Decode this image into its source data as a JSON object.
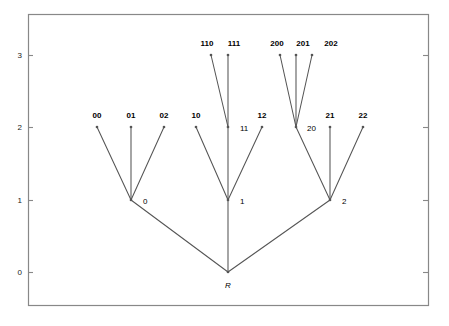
{
  "chart_data": {
    "type": "diagram-tree",
    "title": "",
    "xlabel": "",
    "ylabel": "",
    "ylim": [
      -0.45,
      3.45
    ],
    "xlim": [
      0,
      10
    ],
    "yticks": [
      0,
      1,
      2,
      3
    ],
    "ytick_labels": [
      "0",
      "1",
      "2",
      "3"
    ],
    "grid": false,
    "legend": null,
    "frame": true,
    "x_axis_visible_ticks": false,
    "nodes": [
      {
        "id": "R",
        "label": "R",
        "depth": 0,
        "x": 228,
        "y": 272,
        "label_x": 228,
        "label_y": 288,
        "label_style": "italic",
        "label_anchor": "middle",
        "marker": true
      },
      {
        "id": "0",
        "label": "0",
        "depth": 1,
        "x": 131,
        "y": 200,
        "label_x": 143,
        "label_y": 204,
        "label_style": "plain",
        "label_anchor": "start",
        "marker": true
      },
      {
        "id": "1",
        "label": "1",
        "depth": 1,
        "x": 228,
        "y": 200,
        "label_x": 240,
        "label_y": 204,
        "label_style": "plain",
        "label_anchor": "start",
        "marker": true
      },
      {
        "id": "2",
        "label": "2",
        "depth": 1,
        "x": 330,
        "y": 200,
        "label_x": 342,
        "label_y": 204,
        "label_style": "plain",
        "label_anchor": "start",
        "marker": true
      },
      {
        "id": "00",
        "label": "00",
        "depth": 2,
        "x": 97,
        "y": 127,
        "label_x": 97,
        "label_y": 118,
        "label_style": "bold",
        "label_anchor": "middle",
        "marker": true
      },
      {
        "id": "01",
        "label": "01",
        "depth": 2,
        "x": 131,
        "y": 127,
        "label_x": 131,
        "label_y": 118,
        "label_style": "bold",
        "label_anchor": "middle",
        "marker": true
      },
      {
        "id": "02",
        "label": "02",
        "depth": 2,
        "x": 164,
        "y": 127,
        "label_x": 164,
        "label_y": 118,
        "label_style": "bold",
        "label_anchor": "middle",
        "marker": true
      },
      {
        "id": "10",
        "label": "10",
        "depth": 2,
        "x": 196,
        "y": 127,
        "label_x": 196,
        "label_y": 118,
        "label_style": "bold",
        "label_anchor": "middle",
        "marker": true
      },
      {
        "id": "11",
        "label": "11",
        "depth": 2,
        "x": 228,
        "y": 127,
        "label_x": 240,
        "label_y": 131,
        "label_style": "plain",
        "label_anchor": "start",
        "marker": true
      },
      {
        "id": "12",
        "label": "12",
        "depth": 2,
        "x": 262,
        "y": 127,
        "label_x": 262,
        "label_y": 118,
        "label_style": "bold",
        "label_anchor": "middle",
        "marker": true
      },
      {
        "id": "20",
        "label": "20",
        "depth": 2,
        "x": 296,
        "y": 127,
        "label_x": 307,
        "label_y": 131,
        "label_style": "plain",
        "label_anchor": "start",
        "marker": true
      },
      {
        "id": "21",
        "label": "21",
        "depth": 2,
        "x": 330,
        "y": 127,
        "label_x": 330,
        "label_y": 118,
        "label_style": "bold",
        "label_anchor": "middle",
        "marker": true
      },
      {
        "id": "22",
        "label": "22",
        "depth": 2,
        "x": 363,
        "y": 127,
        "label_x": 363,
        "label_y": 118,
        "label_style": "bold",
        "label_anchor": "middle",
        "marker": true
      },
      {
        "id": "110",
        "label": "110",
        "depth": 3,
        "x": 211,
        "y": 55,
        "label_x": 207,
        "label_y": 46,
        "label_style": "bold",
        "label_anchor": "middle",
        "marker": true
      },
      {
        "id": "111",
        "label": "111",
        "depth": 3,
        "x": 228,
        "y": 55,
        "label_x": 234,
        "label_y": 46,
        "label_style": "bold",
        "label_anchor": "middle",
        "marker": true
      },
      {
        "id": "200",
        "label": "200",
        "depth": 3,
        "x": 280,
        "y": 55,
        "label_x": 277,
        "label_y": 46,
        "label_style": "bold",
        "label_anchor": "middle",
        "marker": true
      },
      {
        "id": "201",
        "label": "201",
        "depth": 3,
        "x": 296,
        "y": 55,
        "label_x": 303,
        "label_y": 46,
        "label_style": "bold",
        "label_anchor": "middle",
        "marker": true
      },
      {
        "id": "202",
        "label": "202",
        "depth": 3,
        "x": 312,
        "y": 55,
        "label_x": 331,
        "label_y": 46,
        "label_style": "bold",
        "label_anchor": "middle",
        "marker": true
      }
    ],
    "edges": [
      {
        "from": "R",
        "to": "0"
      },
      {
        "from": "R",
        "to": "1"
      },
      {
        "from": "R",
        "to": "2"
      },
      {
        "from": "0",
        "to": "00"
      },
      {
        "from": "0",
        "to": "01"
      },
      {
        "from": "0",
        "to": "02"
      },
      {
        "from": "1",
        "to": "10"
      },
      {
        "from": "1",
        "to": "11"
      },
      {
        "from": "1",
        "to": "12"
      },
      {
        "from": "2",
        "to": "20"
      },
      {
        "from": "2",
        "to": "21"
      },
      {
        "from": "2",
        "to": "22"
      },
      {
        "from": "11",
        "to": "110"
      },
      {
        "from": "11",
        "to": "111"
      },
      {
        "from": "20",
        "to": "200"
      },
      {
        "from": "20",
        "to": "201"
      },
      {
        "from": "20",
        "to": "202"
      }
    ]
  },
  "axis": {
    "ticks": [
      {
        "label": "3",
        "x": 22,
        "y": 58,
        "tick_y": 55
      },
      {
        "label": "2",
        "x": 22,
        "y": 130,
        "tick_y": 127
      },
      {
        "label": "1",
        "x": 22,
        "y": 203,
        "tick_y": 200
      },
      {
        "label": "0",
        "x": 22,
        "y": 275,
        "tick_y": 272
      }
    ]
  },
  "frame": {
    "left": 28,
    "top": 14,
    "right": 428,
    "bottom": 305
  },
  "colors": {
    "line": "#555555",
    "frame": "#888888",
    "text": "#000000",
    "tick_text": "#1a1a1a",
    "background": "#ffffff"
  }
}
